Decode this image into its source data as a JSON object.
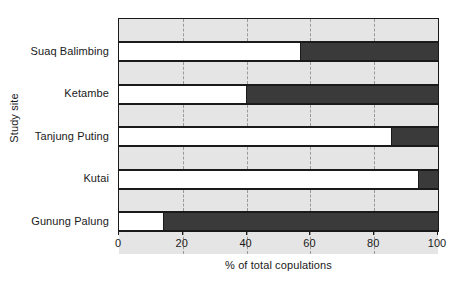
{
  "chart_data": {
    "type": "bar",
    "orientation": "horizontal",
    "stacked": true,
    "title": "",
    "xlabel": "% of total copulations",
    "ylabel": "Study site",
    "categories": [
      "Suaq Balimbing",
      "Ketambe",
      "Tanjung Puting",
      "Kutai",
      "Gunung Palung"
    ],
    "xlim": [
      0,
      100
    ],
    "xticks": [
      0,
      20,
      40,
      60,
      80,
      100
    ],
    "xticklabels": [
      "0",
      "20",
      "40",
      "60",
      "80",
      "100"
    ],
    "grid": "vertical-dashed",
    "legend": "none",
    "series": [
      {
        "name": "white-segment",
        "color": "#ffffff",
        "values": [
          57,
          40,
          85.5,
          94,
          14
        ]
      },
      {
        "name": "dark-segment",
        "color": "#3a3a3a",
        "values": [
          43,
          60,
          14.5,
          6,
          86
        ]
      }
    ]
  },
  "style": {
    "band_color": "#e5e5e5",
    "axis_color": "#1a1a1a",
    "grid_color": "#9a9a9a",
    "bar_white": "#ffffff",
    "bar_dark": "#3a3a3a",
    "background": "#ffffff"
  }
}
